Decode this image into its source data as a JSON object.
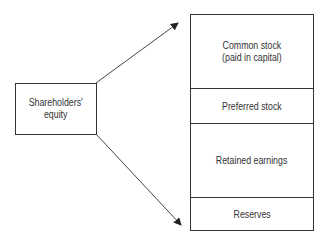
{
  "source_box": {
    "line1": "Shareholders'",
    "line2": "equity"
  },
  "components": [
    {
      "line1": "Common stock",
      "line2": "(paid in capital)"
    },
    {
      "line1": "Preferred stock"
    },
    {
      "line1": "Retained earnings"
    },
    {
      "line1": "Reserves"
    }
  ],
  "colors": {
    "stroke": "#333333",
    "background": "#ffffff"
  }
}
